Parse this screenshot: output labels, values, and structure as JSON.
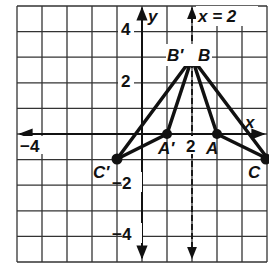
{
  "grid": {
    "xmin": -5,
    "xmax": 5,
    "ymin": -5,
    "ymax": 5,
    "origin_px": [
      142,
      134
    ],
    "unit_px": 25.2
  },
  "axes": {
    "x_label": "x",
    "y_label": "y"
  },
  "tick_labels": {
    "x_neg4": "−4",
    "x_2": "2",
    "y_4": "4",
    "y_2": "2",
    "y_neg2": "−2",
    "y_neg4": "−4"
  },
  "reflection_line": {
    "label": "x = 2",
    "x": 2,
    "style": "dashed"
  },
  "points": {
    "A": {
      "label": "A",
      "x": 3,
      "y": 0
    },
    "B": {
      "label": "B",
      "x": 2,
      "y": 3
    },
    "C": {
      "label": "C",
      "x": 5,
      "y": -1
    },
    "A_prime": {
      "label": "A′",
      "x": 1,
      "y": 0
    },
    "B_prime": {
      "label": "B′",
      "x": 2,
      "y": 3
    },
    "C_prime": {
      "label": "C′",
      "x": -1,
      "y": -1
    }
  },
  "triangles": [
    {
      "name": "ABC",
      "vertices": [
        "A",
        "B",
        "C"
      ]
    },
    {
      "name": "A′B′C′",
      "vertices": [
        "A_prime",
        "B_prime",
        "C_prime"
      ]
    }
  ]
}
